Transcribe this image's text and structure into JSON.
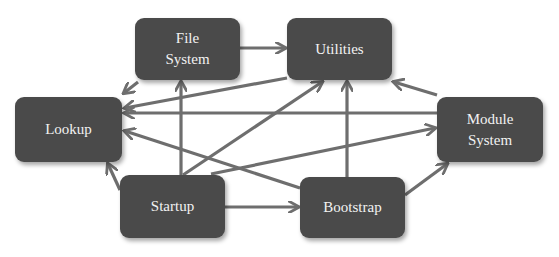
{
  "diagram": {
    "type": "dependency-graph",
    "colors": {
      "node_fill": "#4a4a4a",
      "node_text": "#f2f2f2",
      "edge": "#6e6e6e",
      "background": "#ffffff"
    },
    "nodes": [
      {
        "id": "file_system",
        "label": "File\nSystem",
        "x": 135,
        "y": 18,
        "w": 105,
        "h": 62
      },
      {
        "id": "utilities",
        "label": "Utilities",
        "x": 287,
        "y": 18,
        "w": 105,
        "h": 62
      },
      {
        "id": "lookup",
        "label": "Lookup",
        "x": 15,
        "y": 97,
        "w": 107,
        "h": 65
      },
      {
        "id": "module_system",
        "label": "Module\nSystem",
        "x": 437,
        "y": 97,
        "w": 106,
        "h": 65
      },
      {
        "id": "startup",
        "label": "Startup",
        "x": 120,
        "y": 175,
        "w": 105,
        "h": 63
      },
      {
        "id": "bootstrap",
        "label": "Bootstrap",
        "x": 300,
        "y": 177,
        "w": 105,
        "h": 61
      }
    ],
    "edges": [
      {
        "from": "file_system",
        "to": "utilities",
        "x1": 240,
        "y1": 48,
        "x2": 285,
        "y2": 48
      },
      {
        "from": "file_system",
        "to": "lookup",
        "x1": 138,
        "y1": 82,
        "x2": 124,
        "y2": 93
      },
      {
        "from": "utilities",
        "to": "lookup",
        "x1": 287,
        "y1": 78,
        "x2": 125,
        "y2": 108
      },
      {
        "from": "module_system",
        "to": "lookup",
        "x1": 437,
        "y1": 113,
        "x2": 125,
        "y2": 113
      },
      {
        "from": "module_system",
        "to": "utilities",
        "x1": 437,
        "y1": 95,
        "x2": 394,
        "y2": 82
      },
      {
        "from": "startup",
        "to": "file_system",
        "x1": 181,
        "y1": 175,
        "x2": 181,
        "y2": 82
      },
      {
        "from": "startup",
        "to": "utilities",
        "x1": 183,
        "y1": 175,
        "x2": 322,
        "y2": 82
      },
      {
        "from": "startup",
        "to": "lookup",
        "x1": 120,
        "y1": 190,
        "x2": 108,
        "y2": 164
      },
      {
        "from": "startup",
        "to": "module_system",
        "x1": 211,
        "y1": 174,
        "x2": 435,
        "y2": 128
      },
      {
        "from": "startup",
        "to": "bootstrap",
        "x1": 225,
        "y1": 207,
        "x2": 298,
        "y2": 207
      },
      {
        "from": "bootstrap",
        "to": "lookup",
        "x1": 300,
        "y1": 188,
        "x2": 125,
        "y2": 131
      },
      {
        "from": "bootstrap",
        "to": "utilities",
        "x1": 347,
        "y1": 177,
        "x2": 347,
        "y2": 82
      },
      {
        "from": "bootstrap",
        "to": "module_system",
        "x1": 405,
        "y1": 195,
        "x2": 447,
        "y2": 164
      }
    ]
  }
}
